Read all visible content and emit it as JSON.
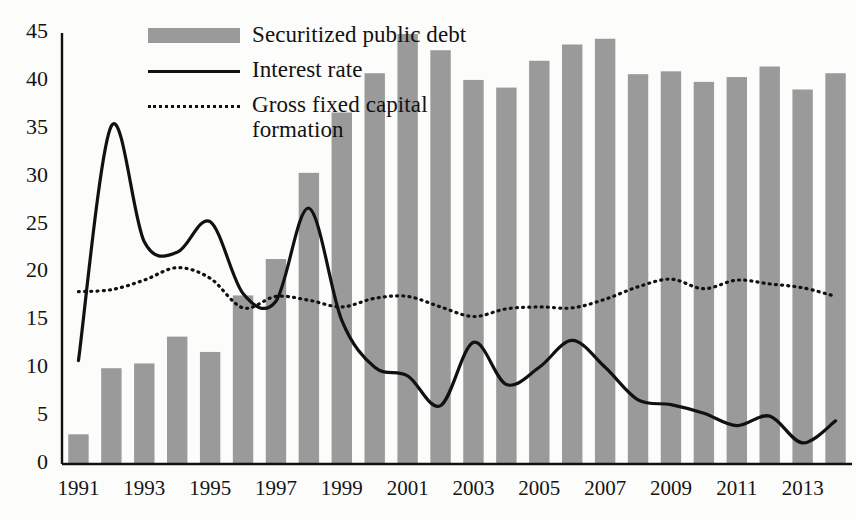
{
  "chart_data": {
    "type": "bar",
    "title": "",
    "subtitle": "",
    "xlabel": "",
    "ylabel": "",
    "xlim": [
      1990.5,
      2014.5
    ],
    "ylim": [
      0,
      45
    ],
    "grid": false,
    "legend_position": "top-left",
    "y_ticks": [
      0,
      5,
      10,
      15,
      20,
      25,
      30,
      35,
      40,
      45
    ],
    "x_ticks": [
      1991,
      1993,
      1995,
      1997,
      1999,
      2001,
      2003,
      2005,
      2007,
      2009,
      2011,
      2013
    ],
    "categories": [
      1991,
      1992,
      1993,
      1994,
      1995,
      1996,
      1997,
      1998,
      1999,
      2000,
      2001,
      2002,
      2003,
      2004,
      2005,
      2006,
      2007,
      2008,
      2009,
      2010,
      2011,
      2012,
      2013,
      2014
    ],
    "series": [
      {
        "name": "Securitized public debt",
        "type": "bar",
        "color": "#9a9a9a",
        "values": [
          3.1,
          10.0,
          10.5,
          13.3,
          11.7,
          17.6,
          21.4,
          30.4,
          36.7,
          40.8,
          44.9,
          43.2,
          40.1,
          39.3,
          42.1,
          43.8,
          44.4,
          40.7,
          41.0,
          39.9,
          40.4,
          41.5,
          39.1,
          40.8
        ]
      },
      {
        "name": "Interest rate",
        "type": "line",
        "color": "#111111",
        "values": [
          10.8,
          35.3,
          23.2,
          22.1,
          25.3,
          17.8,
          17.0,
          26.7,
          15.0,
          10.1,
          9.2,
          6.1,
          12.7,
          8.3,
          10.1,
          12.9,
          10.1,
          6.7,
          6.2,
          5.3,
          4.0,
          5.0,
          2.2,
          4.5
        ]
      },
      {
        "name": "Gross fixed capital formation",
        "type": "line",
        "color": "#111111",
        "values": [
          18.0,
          18.2,
          19.2,
          20.5,
          19.4,
          16.3,
          17.5,
          17.1,
          16.4,
          17.3,
          17.5,
          16.4,
          15.4,
          16.2,
          16.4,
          16.3,
          17.2,
          18.5,
          19.3,
          18.3,
          19.2,
          18.8,
          18.4,
          17.5
        ]
      }
    ]
  },
  "legend": {
    "items": [
      {
        "key": "swatch",
        "label": "Securitized public debt"
      },
      {
        "key": "solid-line",
        "label": "Interest rate"
      },
      {
        "key": "dotted-line",
        "label": "Gross fixed capital"
      },
      {
        "key": "continuation",
        "label": "formation"
      }
    ]
  }
}
